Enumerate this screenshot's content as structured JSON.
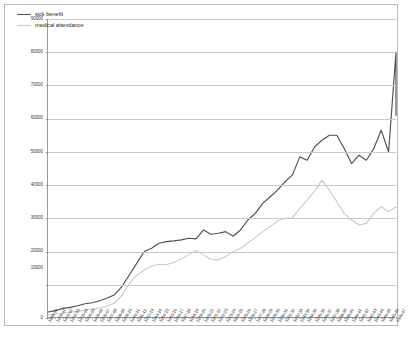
{
  "chart_data": {
    "type": "line",
    "title": "",
    "xlabel": "",
    "ylabel": "",
    "ylim": [
      0,
      90000
    ],
    "ytick_labels": [
      "90000",
      "80000",
      "70000",
      "60000",
      "50000",
      "40000",
      "30000",
      "20000",
      "15000",
      "0"
    ],
    "yticks": [
      0,
      10000,
      20000,
      30000,
      40000,
      50000,
      60000,
      70000,
      80000,
      90000
    ],
    "grid": true,
    "legend_position": "top-left",
    "colors": {
      "sick_benefit": "#4f4f4f",
      "medical_attendance": "#c8c8c8",
      "gridline": "#c9c9c9",
      "axis": "#9a9a9a",
      "frame": "#b9b9b9",
      "text": "#2e2e2e"
    },
    "categories": [
      "1899-00",
      "1900-01",
      "1901-02",
      "1902-03",
      "1903-04",
      "1904-05",
      "1905-06",
      "1906-07",
      "1907-08",
      "1908-09",
      "1909-10",
      "1910-11",
      "1911-12",
      "1912-13",
      "1913-14",
      "1914-15",
      "1915-16",
      "1916-17",
      "1917-18",
      "1918-19",
      "1919-20",
      "1920-21",
      "1921-22",
      "1922-23",
      "1923-24",
      "1924-25",
      "1925-26",
      "1926-27",
      "1927-28",
      "1928-29",
      "1929-30",
      "1930-31",
      "1931-32",
      "1932-33",
      "1933-34",
      "1934-35",
      "1935-36",
      "1936-37",
      "1937-38",
      "1938-39",
      "1939-40",
      "1940-41",
      "1941-42",
      "1942-43",
      "1943-44",
      "1944-45",
      "1945-46",
      "1946-47"
    ],
    "series": [
      {
        "name": "sick benefit",
        "color": "#4f4f4f",
        "values": [
          1800,
          2200,
          2900,
          3200,
          3700,
          4300,
          4600,
          5200,
          6000,
          7000,
          9500,
          13000,
          16500,
          20000,
          21000,
          22500,
          23000,
          23200,
          23500,
          24000,
          23800,
          26500,
          25200,
          25500,
          26000,
          24600,
          26500,
          29500,
          31500,
          34500,
          36500,
          38500,
          41000,
          43000,
          48500,
          47500,
          51500,
          53500,
          55000,
          55000,
          51000,
          46500,
          49000,
          47500,
          51000,
          56500,
          50000,
          80000
        ]
      },
      {
        "name": "medical attendance",
        "color": "#c8c8c8",
        "values": [
          900,
          1100,
          1400,
          1700,
          2000,
          2400,
          2700,
          3000,
          3600,
          4500,
          6800,
          10500,
          12800,
          14500,
          15700,
          16200,
          16000,
          16800,
          17800,
          19000,
          20300,
          19000,
          17600,
          17500,
          18500,
          19900,
          21000,
          22600,
          24200,
          26000,
          27500,
          29200,
          30000,
          30200,
          33000,
          35500,
          38200,
          41500,
          38500,
          35000,
          31500,
          29500,
          28000,
          28500,
          31500,
          33500,
          32000,
          33500
        ]
      }
    ],
    "series_tail": [
      {
        "name": "sick benefit",
        "final_value": 61000
      },
      {
        "name": "medical attendance",
        "final_value": 33200
      }
    ]
  }
}
